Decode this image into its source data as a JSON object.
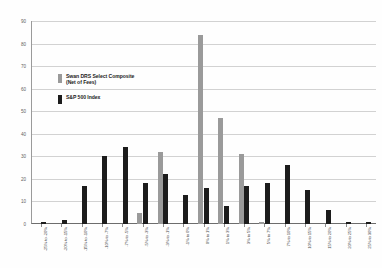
{
  "chart_data": {
    "type": "bar",
    "title": "",
    "subtitle": "",
    "xlabel": "",
    "ylabel": "",
    "ylim": [
      0,
      90
    ],
    "ytick_step": 10,
    "yticks": [
      "0",
      "10",
      "20",
      "30",
      "40",
      "50",
      "60",
      "70",
      "80",
      "90"
    ],
    "grid": true,
    "legend_position": "inside-upper-left",
    "categories": [
      "-25% to -20%",
      "-20% to -15%",
      "-15% to -10%",
      "-10% to -7%",
      "-7% to -5%",
      "-5% to -3%",
      "-3% to -1%",
      "-1% to 0%",
      "0% to 1%",
      "1% to 3%",
      "3% to 5%",
      "5% to 7%",
      "7% to 10%",
      "10% to 15%",
      "15% to 20%",
      "20% to 25%",
      "25% to 30%"
    ],
    "series": [
      {
        "name": "Swan DRS Select Composite (Net of Fees)",
        "color": "#9a9a9a",
        "values": [
          0,
          0,
          0,
          0,
          0,
          5,
          32,
          0,
          84,
          47,
          31,
          1,
          0,
          0,
          0,
          0,
          0
        ]
      },
      {
        "name": "S&P 500 Index",
        "color": "#1c1c1c",
        "values": [
          1,
          2,
          17,
          30,
          34,
          18,
          22,
          13,
          16,
          8,
          17,
          18,
          26,
          15,
          6,
          1,
          1
        ]
      }
    ]
  },
  "legend": {
    "items": [
      {
        "label_line1": "Swan DRS Select Composite",
        "label_line2": "(Net of Fees)",
        "color": "#9a9a9a"
      },
      {
        "label_line1": "S&P 500 Index",
        "label_line2": "",
        "color": "#1c1c1c"
      }
    ]
  }
}
